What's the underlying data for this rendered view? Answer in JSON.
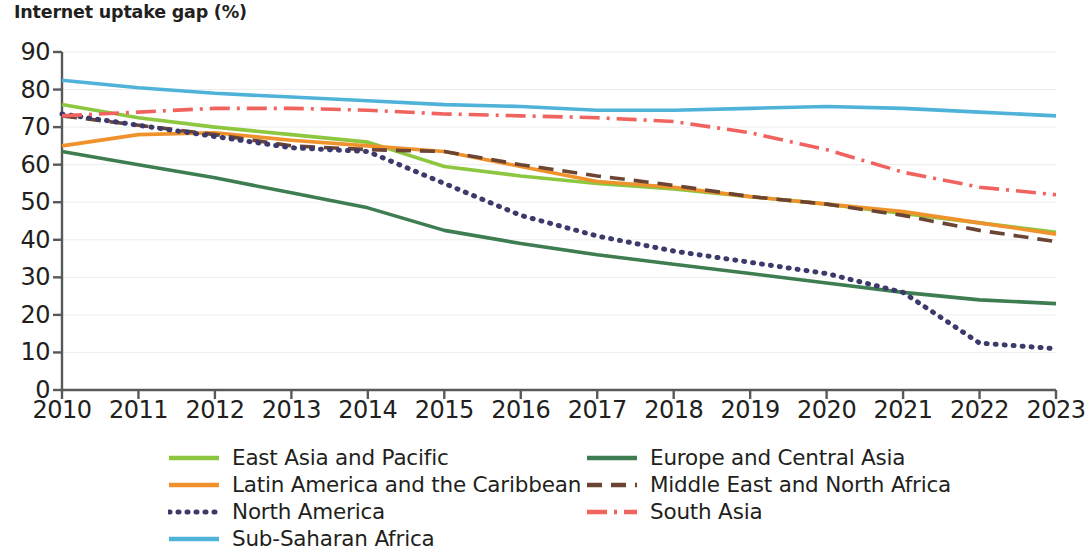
{
  "chart_data": {
    "type": "line",
    "title": "Internet uptake gap (%)",
    "xlabel": "",
    "ylabel": "",
    "x": [
      2010,
      2011,
      2012,
      2013,
      2014,
      2015,
      2016,
      2017,
      2018,
      2019,
      2020,
      2021,
      2022,
      2023
    ],
    "xtick_labels": [
      "2010",
      "2011",
      "2012",
      "2013",
      "2014",
      "2015",
      "2016",
      "2017",
      "2018",
      "2019",
      "2020",
      "2021",
      "2022",
      "2023"
    ],
    "ytick_labels": [
      "0",
      "10",
      "20",
      "30",
      "40",
      "50",
      "60",
      "70",
      "80",
      "90"
    ],
    "ytick_values": [
      0,
      10,
      20,
      30,
      40,
      50,
      60,
      70,
      80,
      90
    ],
    "ylim": [
      0,
      90
    ],
    "xlim": [
      2010,
      2023
    ],
    "grid": true,
    "legend_position": "bottom",
    "series": [
      {
        "name": "East Asia and Pacific",
        "color": "#8DC63F",
        "style": "solid",
        "values": [
          76.0,
          72.5,
          70.0,
          68.0,
          66.0,
          59.5,
          57.0,
          55.0,
          53.5,
          51.5,
          49.5,
          47.0,
          44.5,
          42.0
        ]
      },
      {
        "name": "Europe and Central Asia",
        "color": "#3E7D52",
        "style": "solid",
        "values": [
          63.5,
          60.0,
          56.5,
          52.5,
          48.5,
          42.5,
          39.0,
          36.0,
          33.5,
          31.0,
          28.5,
          26.0,
          24.0,
          23.0
        ]
      },
      {
        "name": "Latin America and the Caribbean",
        "color": "#F0922B",
        "style": "solid",
        "values": [
          65.0,
          68.0,
          68.5,
          66.5,
          65.0,
          63.5,
          59.5,
          55.5,
          54.0,
          51.5,
          49.5,
          47.5,
          44.5,
          41.5
        ]
      },
      {
        "name": "Middle East and North Africa",
        "color": "#6B4434",
        "style": "dashed",
        "values": [
          73.0,
          70.5,
          68.0,
          65.0,
          64.0,
          63.5,
          60.0,
          57.0,
          54.5,
          51.5,
          49.5,
          46.5,
          42.5,
          39.5
        ]
      },
      {
        "name": "North America",
        "color": "#3B3A6B",
        "style": "dotted",
        "values": [
          73.5,
          70.5,
          67.5,
          64.5,
          63.5,
          55.0,
          46.5,
          41.0,
          37.0,
          34.0,
          31.0,
          26.0,
          12.5,
          11.0
        ]
      },
      {
        "name": "South Asia",
        "color": "#F0635E",
        "style": "dashdot",
        "values": [
          73.0,
          74.0,
          75.0,
          75.0,
          74.5,
          73.5,
          73.0,
          72.5,
          71.5,
          68.5,
          64.0,
          58.0,
          54.0,
          52.0
        ]
      },
      {
        "name": "Sub-Saharan Africa",
        "color": "#4FB3D9",
        "style": "solid",
        "values": [
          82.5,
          80.5,
          79.0,
          78.0,
          77.0,
          76.0,
          75.5,
          74.5,
          74.5,
          75.0,
          75.5,
          75.0,
          74.0,
          73.0
        ]
      }
    ]
  }
}
